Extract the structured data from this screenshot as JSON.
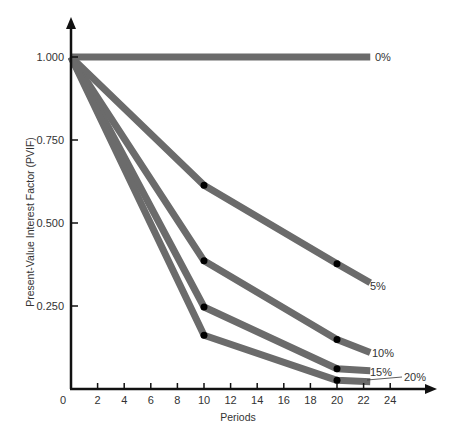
{
  "chart_data": {
    "type": "line",
    "title": "",
    "xlabel": "Periods",
    "ylabel": "Present-Value Interest Factor (PVIF)",
    "xlim": [
      0,
      26
    ],
    "ylim": [
      0,
      1.1
    ],
    "x_ticks": [
      0,
      2,
      4,
      6,
      8,
      10,
      12,
      14,
      16,
      18,
      20,
      22,
      24
    ],
    "x_tick_labels": [
      "0",
      "2",
      "4",
      "6",
      "8",
      "10",
      "12",
      "14",
      "16",
      "18",
      "20",
      "22",
      "24"
    ],
    "y_ticks": [
      0.25,
      0.5,
      0.75,
      1.0
    ],
    "y_tick_labels": [
      "0.250",
      "0.500",
      "0.750",
      "1.000"
    ],
    "grid": false,
    "legend": "inline labels at line ends",
    "series": [
      {
        "name": "0%",
        "x": [
          0,
          22.5
        ],
        "values": [
          1.0,
          1.0
        ],
        "markers": []
      },
      {
        "name": "5%",
        "x": [
          0,
          10,
          20,
          22.5
        ],
        "values": [
          1.0,
          0.614,
          0.377,
          0.32
        ],
        "markers": [
          10,
          20
        ]
      },
      {
        "name": "10%",
        "x": [
          0,
          10,
          20,
          22.5
        ],
        "values": [
          1.0,
          0.386,
          0.149,
          0.11
        ],
        "markers": [
          10,
          20
        ]
      },
      {
        "name": "15%",
        "x": [
          0,
          10,
          20,
          22.5
        ],
        "values": [
          1.0,
          0.247,
          0.061,
          0.055
        ],
        "markers": [
          10,
          20
        ]
      },
      {
        "name": "20%",
        "x": [
          0,
          10,
          20,
          22.5
        ],
        "values": [
          1.0,
          0.162,
          0.026,
          0.022
        ],
        "markers": [
          10,
          20
        ]
      }
    ],
    "colors": {
      "line": "#6b6b6b",
      "axis": "#111111",
      "marker": "#000000",
      "text": "#333333"
    }
  }
}
